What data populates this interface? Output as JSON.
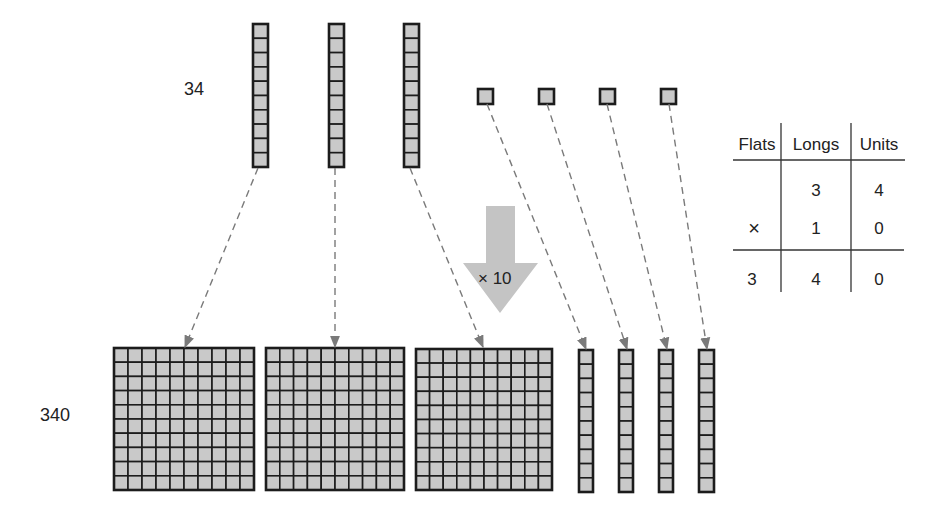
{
  "labels": {
    "top_number": "34",
    "bottom_number": "340",
    "multiplier": "× 10"
  },
  "blocks": {
    "top_longs": [
      {
        "x": 253,
        "y": 24,
        "w": 15,
        "h": 143
      },
      {
        "x": 329,
        "y": 24,
        "w": 15,
        "h": 143
      },
      {
        "x": 404,
        "y": 24,
        "w": 15,
        "h": 143
      }
    ],
    "top_units": [
      {
        "x": 478,
        "y": 89,
        "s": 15
      },
      {
        "x": 539,
        "y": 89,
        "s": 15
      },
      {
        "x": 600,
        "y": 89,
        "s": 15
      },
      {
        "x": 661,
        "y": 89,
        "s": 15
      }
    ],
    "bottom_flats": [
      {
        "x": 114,
        "y": 348,
        "w": 140,
        "h": 142
      },
      {
        "x": 266,
        "y": 348,
        "w": 138,
        "h": 142
      },
      {
        "x": 416,
        "y": 349,
        "w": 136,
        "h": 141
      }
    ],
    "bottom_longs": [
      {
        "x": 579,
        "y": 350,
        "w": 14,
        "h": 142
      },
      {
        "x": 619,
        "y": 350,
        "w": 14,
        "h": 142
      },
      {
        "x": 659,
        "y": 350,
        "w": 14,
        "h": 142
      },
      {
        "x": 699,
        "y": 350,
        "w": 15,
        "h": 142
      }
    ]
  },
  "arrows": [
    {
      "from": [
        258,
        168
      ],
      "to": [
        185,
        347
      ]
    },
    {
      "from": [
        335,
        168
      ],
      "to": [
        335,
        347
      ]
    },
    {
      "from": [
        410,
        168
      ],
      "to": [
        483,
        347
      ]
    },
    {
      "from": [
        487,
        104
      ],
      "to": [
        586,
        349
      ]
    },
    {
      "from": [
        547,
        104
      ],
      "to": [
        627,
        349
      ]
    },
    {
      "from": [
        607,
        104
      ],
      "to": [
        667,
        349
      ]
    },
    {
      "from": [
        669,
        104
      ],
      "to": [
        707,
        349
      ]
    }
  ],
  "place_value_table": {
    "headers": [
      "Flats",
      "Longs",
      "Units"
    ],
    "rows": [
      [
        "",
        "3",
        "4"
      ],
      [
        "×",
        "1",
        "0"
      ],
      [
        "3",
        "4",
        "0"
      ]
    ]
  },
  "colors": {
    "block_fill": "#c9c9c9",
    "block_stroke": "#1c1c1c",
    "arrow_fill": "#c4c4c4",
    "dash": "#7a7a7a"
  }
}
